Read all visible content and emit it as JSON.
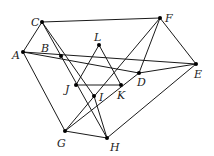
{
  "diagram": {
    "title": "",
    "points": [
      {
        "id": "A",
        "label": "A",
        "x": 23,
        "y": 52,
        "lx": 12,
        "ly": 59
      },
      {
        "id": "B",
        "label": "B",
        "x": 61,
        "y": 56,
        "lx": 41,
        "ly": 52
      },
      {
        "id": "C",
        "label": "C",
        "x": 42,
        "y": 22,
        "lx": 31,
        "ly": 26
      },
      {
        "id": "D",
        "label": "D",
        "x": 139,
        "y": 73,
        "lx": 137,
        "ly": 86
      },
      {
        "id": "E",
        "label": "E",
        "x": 196,
        "y": 64,
        "lx": 194,
        "ly": 78
      },
      {
        "id": "F",
        "label": "F",
        "x": 160,
        "y": 18,
        "lx": 165,
        "ly": 22
      },
      {
        "id": "G",
        "label": "G",
        "x": 65,
        "y": 131,
        "lx": 57,
        "ly": 147
      },
      {
        "id": "H",
        "label": "H",
        "x": 107,
        "y": 138,
        "lx": 110,
        "ly": 151
      },
      {
        "id": "I",
        "label": "I",
        "x": 94,
        "y": 96,
        "lx": 99,
        "ly": 101
      },
      {
        "id": "J",
        "label": "J",
        "x": 76,
        "y": 85,
        "lx": 65,
        "ly": 93
      },
      {
        "id": "K",
        "label": "K",
        "x": 121,
        "y": 85,
        "lx": 117,
        "ly": 99
      },
      {
        "id": "L",
        "label": "L",
        "x": 99,
        "y": 45,
        "lx": 94,
        "ly": 41
      }
    ],
    "segments": [
      [
        "C",
        "F"
      ],
      [
        "C",
        "A"
      ],
      [
        "A",
        "G"
      ],
      [
        "A",
        "E"
      ],
      [
        "A",
        "D"
      ],
      [
        "F",
        "E"
      ],
      [
        "F",
        "D"
      ],
      [
        "F",
        "G"
      ],
      [
        "E",
        "H"
      ],
      [
        "G",
        "H"
      ],
      [
        "C",
        "H"
      ],
      [
        "C",
        "I"
      ],
      [
        "I",
        "H"
      ],
      [
        "L",
        "J"
      ],
      [
        "L",
        "K"
      ],
      [
        "J",
        "K"
      ],
      [
        "G",
        "D"
      ],
      [
        "D",
        "E"
      ]
    ]
  }
}
